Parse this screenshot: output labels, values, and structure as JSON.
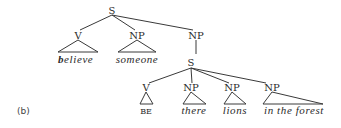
{
  "figure_label": "(b)",
  "tree": {
    "root": "S",
    "children": [
      {
        "label": "V",
        "leaf": "believe",
        "leaf_bold_initial": "b",
        "leaf_rest": "elieve"
      },
      {
        "label": "NP",
        "leaf": "someone"
      },
      {
        "label": "NP",
        "children": [
          {
            "label": "S",
            "children": [
              {
                "label": "V",
                "leaf": "BE"
              },
              {
                "label": "NP",
                "leaf": "there"
              },
              {
                "label": "NP",
                "leaf": "lions"
              },
              {
                "label": "NP",
                "leaf": "in the forest"
              }
            ]
          }
        ]
      }
    ]
  },
  "nodes": {
    "root_s": "S",
    "v1": "V",
    "np1": "NP",
    "np2": "NP",
    "s2": "S",
    "v2": "V",
    "np3": "NP",
    "np4": "NP",
    "np5": "NP"
  },
  "leaves": {
    "believe_b": "b",
    "believe_rest": "elieve",
    "someone": "someone",
    "be": "BE",
    "there": "there",
    "lions": "lions",
    "in_the_forest": "in the forest"
  }
}
